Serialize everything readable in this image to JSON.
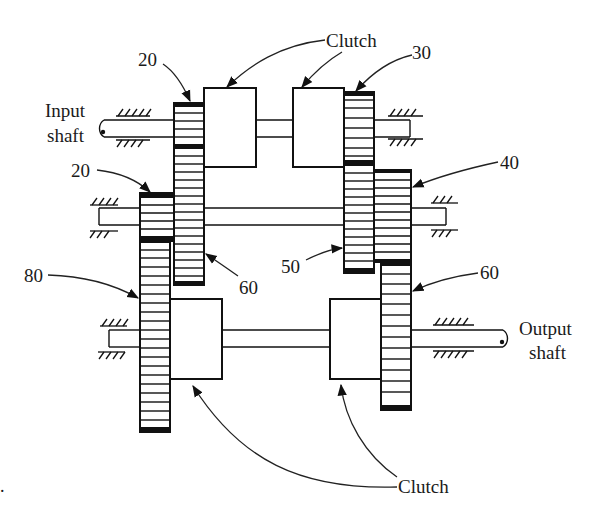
{
  "diagram": {
    "type": "gear-train-schematic",
    "colors": {
      "ink": "#111111",
      "background": "#ffffff"
    }
  },
  "shafts": {
    "input": {
      "label_line1": "Input",
      "label_line2": "shaft"
    },
    "output": {
      "label_line1": "Output",
      "label_line2": "shaft"
    },
    "counter": {
      "label": ""
    }
  },
  "gears": [
    {
      "id": "g-input-20",
      "teeth": "20",
      "shaft": "input"
    },
    {
      "id": "g-counter-60",
      "teeth": "60",
      "shaft": "counter"
    },
    {
      "id": "g-counter-20",
      "teeth": "20",
      "shaft": "counter"
    },
    {
      "id": "g-output-80",
      "teeth": "80",
      "shaft": "output"
    },
    {
      "id": "g-input-30",
      "teeth": "30",
      "shaft": "input"
    },
    {
      "id": "g-counter-50",
      "teeth": "50",
      "shaft": "counter"
    },
    {
      "id": "g-counter-40",
      "teeth": "40",
      "shaft": "counter"
    },
    {
      "id": "g-output-60",
      "teeth": "60",
      "shaft": "output"
    }
  ],
  "clutches": {
    "top_label": "Clutch",
    "bottom_label": "Clutch"
  },
  "footnote_mark": "."
}
